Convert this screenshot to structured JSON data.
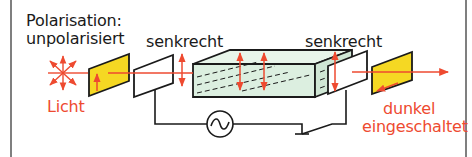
{
  "labels": {
    "polarisation_title": "Polarisation:",
    "source_state": "unpolarisiert",
    "light": "Licht",
    "polarizer_1": "senkrecht",
    "polarizer_2": "senkrecht",
    "output_state": "dunkel",
    "output_mode": "eingeschaltet"
  },
  "icons": {
    "light_source": "starburst-icon",
    "ac_source": "ac-voltage-source-icon",
    "switch": "closed-switch-icon"
  },
  "colors": {
    "frame": "#555555",
    "line": "#1a1a1a",
    "beam": "#ee4a30",
    "filter_yellow": "#f5d823",
    "crystal_fill": "#dcefe0",
    "text_dark": "#1a1a1a",
    "text_red": "#ee4a30"
  }
}
